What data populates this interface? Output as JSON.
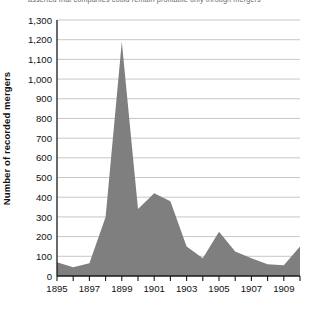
{
  "caption": {
    "text": "asserted that companies could remain profitable only through mergers"
  },
  "chart_data": {
    "type": "area",
    "title": "",
    "subtitle": "",
    "xlabel": "",
    "ylabel": "Number of recorded mergers",
    "xlim": [
      1895,
      1910
    ],
    "ylim": [
      0,
      1300
    ],
    "ytick_step": 100,
    "grid": true,
    "legend": false,
    "legend_position": "none",
    "series_color": "#7f7f7f",
    "axis_color": "#1a1a1a",
    "grid_color": "#b9b9b9",
    "x": [
      1895,
      1896,
      1897,
      1898,
      1899,
      1900,
      1901,
      1902,
      1903,
      1904,
      1905,
      1906,
      1907,
      1908,
      1909,
      1910
    ],
    "values": [
      70,
      45,
      65,
      300,
      1190,
      340,
      420,
      380,
      150,
      90,
      225,
      125,
      90,
      60,
      55,
      150
    ],
    "categories": [
      "1895",
      "1896",
      "1897",
      "1898",
      "1899",
      "1900",
      "1901",
      "1902",
      "1903",
      "1904",
      "1905",
      "1906",
      "1907",
      "1908",
      "1909",
      "1910"
    ],
    "ytick_labels": [
      "0",
      "100",
      "200",
      "300",
      "400",
      "500",
      "600",
      "700",
      "800",
      "900",
      "1,000",
      "1,100",
      "1,200",
      "1,300"
    ],
    "ytick_values": [
      0,
      100,
      200,
      300,
      400,
      500,
      600,
      700,
      800,
      900,
      1000,
      1100,
      1200,
      1300
    ],
    "xtick_values": [
      1895,
      1896,
      1897,
      1898,
      1899,
      1900,
      1901,
      1902,
      1903,
      1904,
      1905,
      1906,
      1907,
      1908,
      1909,
      1910
    ],
    "xtick_labels_shown": [
      "1895",
      "1897",
      "1899",
      "1901",
      "1903",
      "1905",
      "1907",
      "1909"
    ],
    "xtick_labels_shown_values": [
      1895,
      1897,
      1899,
      1901,
      1903,
      1905,
      1907,
      1909
    ],
    "annotations": []
  }
}
